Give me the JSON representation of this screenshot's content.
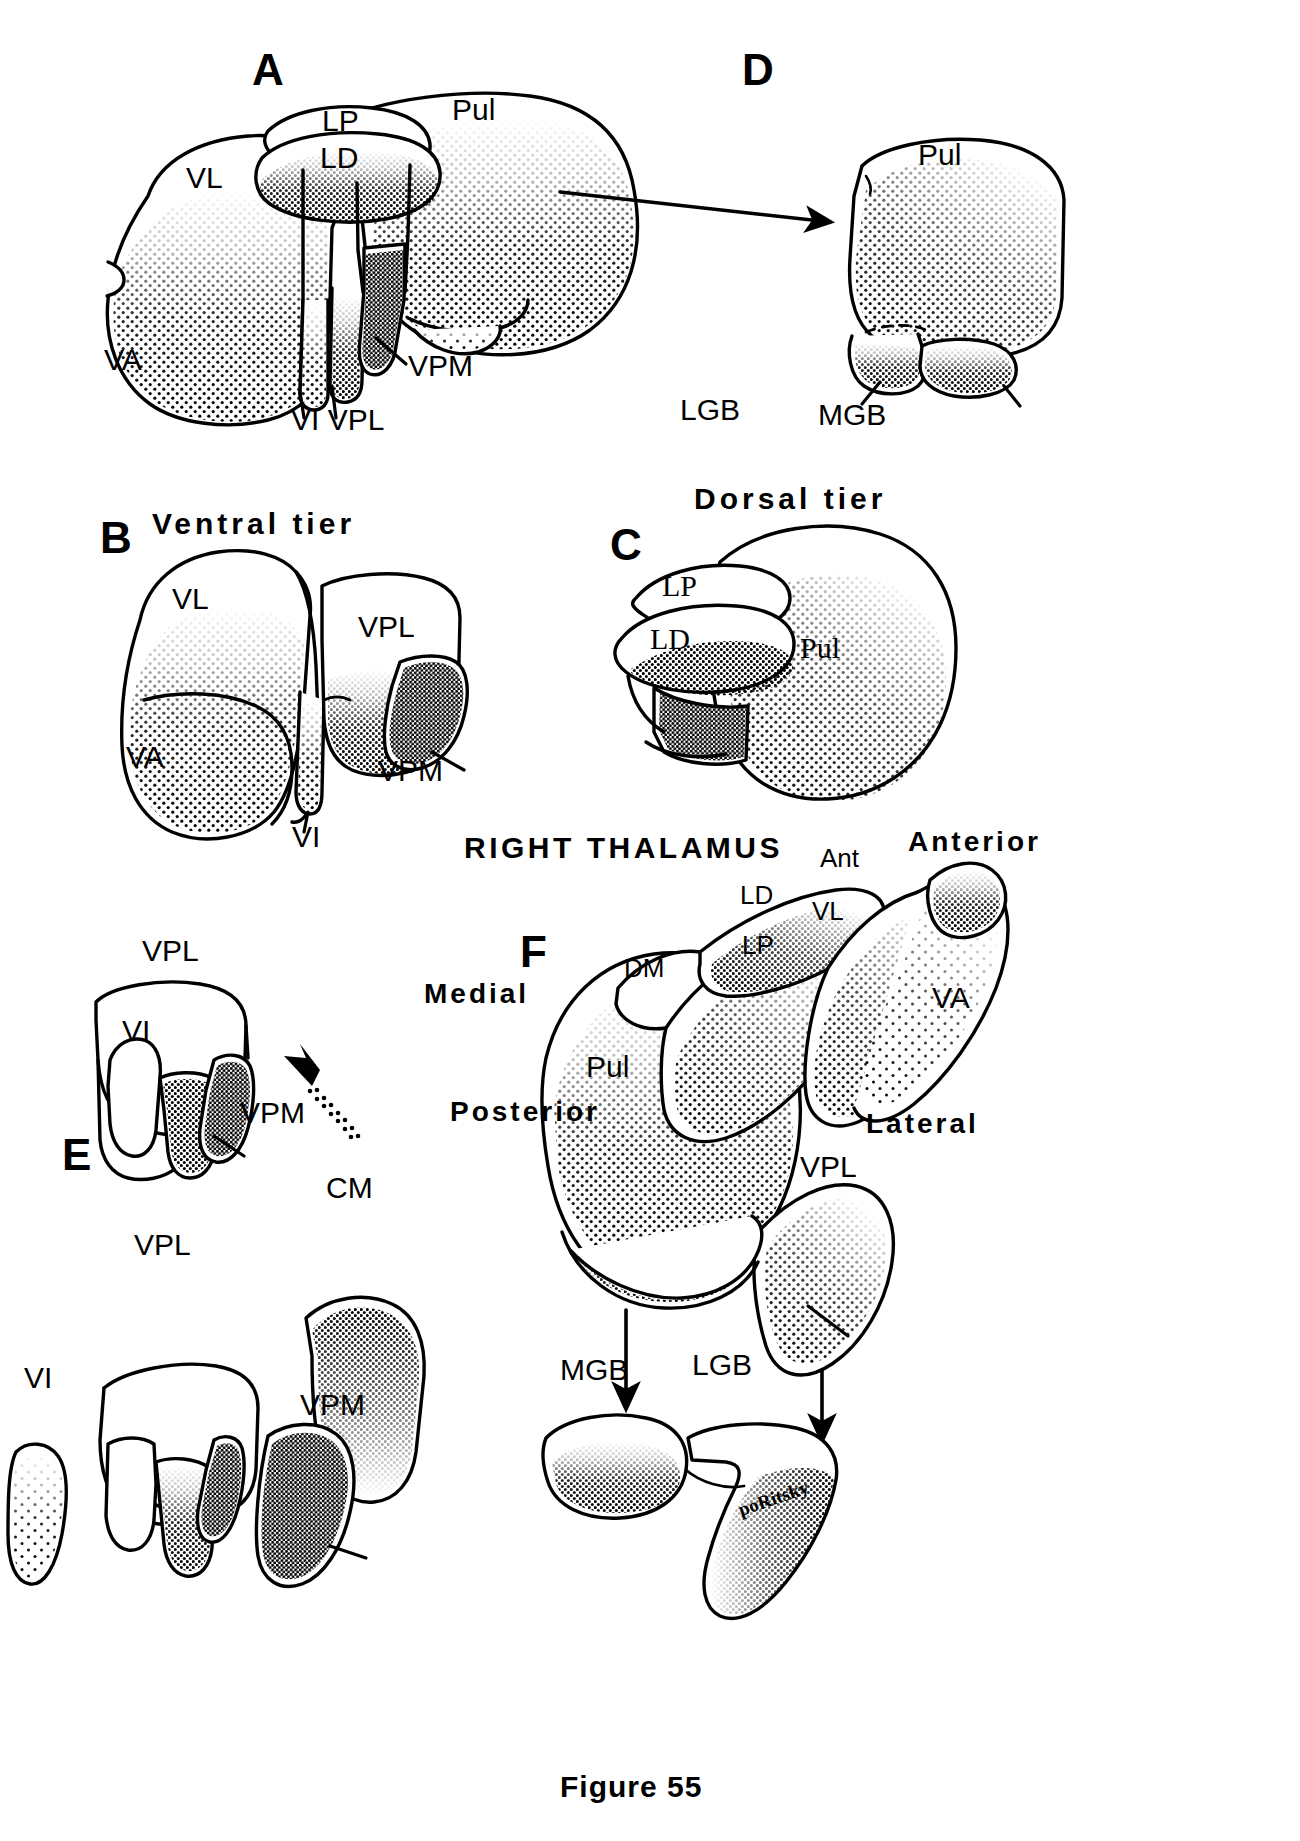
{
  "figure": {
    "caption": "Figure 55",
    "signature": "poRitsky",
    "background_color": "#ffffff",
    "ink_color": "#000000"
  },
  "panels": [
    {
      "letter": "A",
      "title": "",
      "structures": [
        "LP",
        "Pul",
        "LD",
        "VL",
        "VA",
        "VPM",
        "VI",
        "VPL"
      ]
    },
    {
      "letter": "D",
      "title": "",
      "structures": [
        "Pul",
        "LGB",
        "MGB"
      ]
    },
    {
      "letter": "B",
      "title": "Ventral tier",
      "structures": [
        "VL",
        "VPL",
        "VA",
        "VPM",
        "VI"
      ]
    },
    {
      "letter": "C",
      "title": "Dorsal tier",
      "structures": [
        "LP",
        "LD",
        "Pul"
      ]
    },
    {
      "letter": "E",
      "title": "",
      "structures": [
        "VPL",
        "VI",
        "VPM",
        "CM"
      ]
    },
    {
      "letter": "F",
      "title": "RIGHT THALAMUS",
      "structures": [
        "Ant",
        "LD",
        "VL",
        "LP",
        "DM",
        "VA",
        "Pul",
        "VPL",
        "MGB",
        "LGB"
      ],
      "orientations": [
        "Anterior",
        "Medial",
        "Posterior",
        "Lateral"
      ]
    }
  ],
  "labels": {
    "panel_a": {
      "letter": "A",
      "lp": "LP",
      "pul": "Pul",
      "ld": "LD",
      "vl": "VL",
      "va": "VA",
      "vpm": "VPM",
      "vi_vpl": "VI VPL"
    },
    "panel_d": {
      "letter": "D",
      "pul": "Pul",
      "lgb": "LGB",
      "mgb": "MGB"
    },
    "panel_b": {
      "letter": "B",
      "title": "Ventral tier",
      "vl": "VL",
      "vpl": "VPL",
      "va": "VA",
      "vpm": "VPM",
      "vi": "VI"
    },
    "panel_c": {
      "letter": "C",
      "title": "Dorsal tier",
      "lp": "LP",
      "ld": "LD",
      "pul": "Pul"
    },
    "panel_e": {
      "letter": "E",
      "vpl_top": "VPL",
      "vi_top": "VI",
      "vpm_top": "VPM",
      "vpl_bottom": "VPL",
      "cm": "CM",
      "vi_bottom": "VI",
      "vpm_bottom": "VPM"
    },
    "panel_f": {
      "letter": "F",
      "title": "RIGHT THALAMUS",
      "anterior": "Anterior",
      "medial": "Medial",
      "posterior": "Posterior",
      "lateral": "Lateral",
      "ant": "Ant",
      "ld": "LD",
      "vl": "VL",
      "lp": "LP",
      "dm": "DM",
      "va": "VA",
      "pul": "Pul",
      "vpl": "VPL",
      "mgb": "MGB",
      "lgb": "LGB"
    }
  }
}
